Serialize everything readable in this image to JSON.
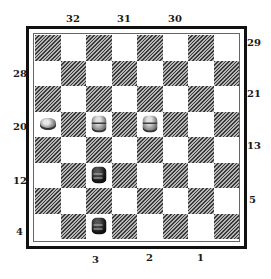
{
  "board": {
    "size": 8,
    "dark_square_parity": "even",
    "colors": {
      "dark_hatch": "#3a3a3a",
      "light": "#ffffff",
      "border": "#111111"
    },
    "pieces": [
      {
        "row": 3,
        "col": 0,
        "color": "white",
        "king": false
      },
      {
        "row": 3,
        "col": 2,
        "color": "white",
        "king": true
      },
      {
        "row": 3,
        "col": 4,
        "color": "white",
        "king": true
      },
      {
        "row": 5,
        "col": 2,
        "color": "black",
        "king": true
      },
      {
        "row": 7,
        "col": 2,
        "color": "black",
        "king": true
      }
    ]
  },
  "labels": {
    "top": [
      {
        "text": "32",
        "x": 66,
        "y": 14
      },
      {
        "text": "31",
        "x": 117,
        "y": 14
      },
      {
        "text": "30",
        "x": 168,
        "y": 14
      }
    ],
    "right": [
      {
        "text": "29",
        "x": 247,
        "y": 38
      },
      {
        "text": "21",
        "x": 247,
        "y": 89
      },
      {
        "text": "13",
        "x": 247,
        "y": 141
      },
      {
        "text": "5",
        "x": 249,
        "y": 195
      }
    ],
    "left": [
      {
        "text": "28",
        "x": 13,
        "y": 69
      },
      {
        "text": "20",
        "x": 13,
        "y": 122
      },
      {
        "text": "12",
        "x": 13,
        "y": 176
      },
      {
        "text": "4",
        "x": 16,
        "y": 227
      }
    ],
    "bottom": [
      {
        "text": "3",
        "x": 92,
        "y": 255
      },
      {
        "text": "2",
        "x": 146,
        "y": 253
      },
      {
        "text": "1",
        "x": 197,
        "y": 253
      }
    ]
  }
}
